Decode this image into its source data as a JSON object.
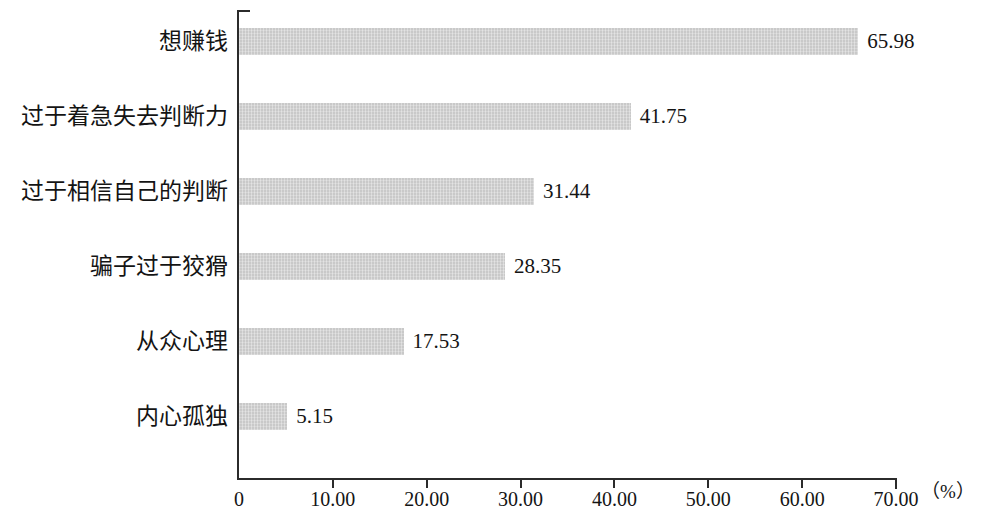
{
  "chart_data": {
    "type": "bar",
    "orientation": "horizontal",
    "title": "",
    "xlabel": "（%）",
    "ylabel": "",
    "xlim": [
      0,
      70
    ],
    "grid": false,
    "legend": null,
    "bar_color": "#c9c9c9",
    "axis_color": "#2b2b2b",
    "text_color": "#141414",
    "categories": [
      "想赚钱",
      "过于着急失去判断力",
      "过于相信自己的判断",
      "骗子过于狡猾",
      "从众心理",
      "内心孤独"
    ],
    "values": [
      65.98,
      41.75,
      31.44,
      28.35,
      17.53,
      5.15
    ],
    "value_labels": [
      "65.98",
      "41.75",
      "31.44",
      "28.35",
      "17.53",
      "5.15"
    ],
    "xticks": [
      0,
      10,
      20,
      30,
      40,
      50,
      60,
      70
    ],
    "xtick_labels": [
      "0",
      "10.00",
      "20.00",
      "30.00",
      "40.00",
      "50.00",
      "60.00",
      "70.00"
    ]
  }
}
